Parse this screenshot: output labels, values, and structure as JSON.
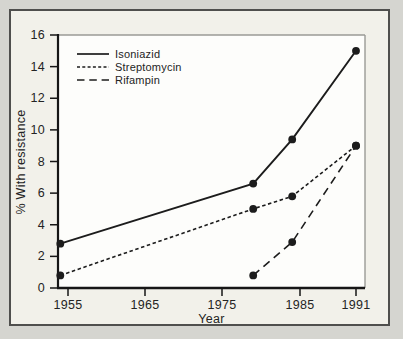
{
  "chart_data": {
    "type": "line",
    "title": "",
    "xlabel": "Year",
    "ylabel": "% With resistance",
    "x_ticks": [
      1955,
      1965,
      1975,
      1985,
      1991
    ],
    "y_ticks": [
      0,
      2,
      4,
      6,
      8,
      10,
      12,
      14,
      16
    ],
    "ylim": [
      0,
      16
    ],
    "grid": "off",
    "legend_position": "top-left",
    "marker": "filled-circle",
    "line_color": "#1c1c1c",
    "series": [
      {
        "name": "Isoniazid",
        "line_style": "solid",
        "points": [
          [
            1954,
            2.8
          ],
          [
            1979,
            6.6
          ],
          [
            1984,
            9.4
          ],
          [
            1991,
            15.0
          ]
        ]
      },
      {
        "name": "Streptomycin",
        "line_style": "short-dash",
        "points": [
          [
            1954,
            0.8
          ],
          [
            1979,
            5.0
          ],
          [
            1984,
            5.8
          ],
          [
            1991,
            9.0
          ]
        ]
      },
      {
        "name": "Rifampin",
        "line_style": "long-dash",
        "points": [
          [
            1979,
            0.8
          ],
          [
            1984,
            2.9
          ],
          [
            1991,
            9.0
          ]
        ]
      }
    ]
  }
}
